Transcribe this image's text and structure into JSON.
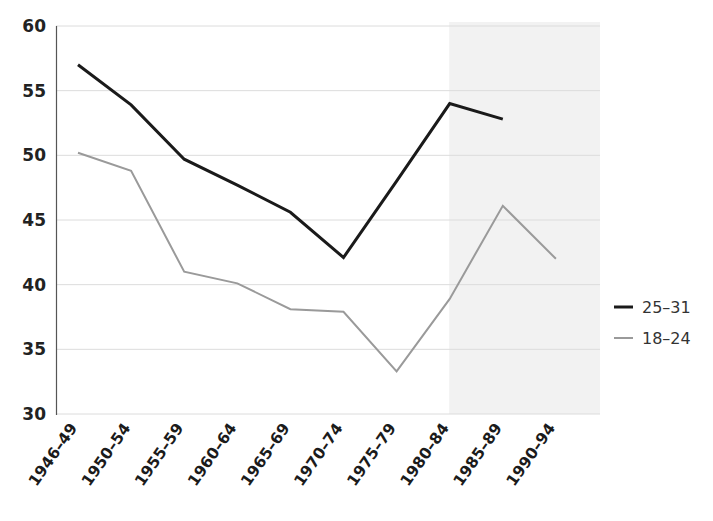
{
  "chart_data": {
    "type": "line",
    "title": "",
    "xlabel": "",
    "ylabel": "",
    "categories": [
      "1946–49",
      "1950–54",
      "1955–59",
      "1960–64",
      "1965–69",
      "1970–74",
      "1975–79",
      "1980–84",
      "1985–89",
      "1990–94"
    ],
    "ylim": [
      30,
      60
    ],
    "yticks": [
      30,
      35,
      40,
      45,
      50,
      55,
      60
    ],
    "ytick_labels": [
      "30",
      "35",
      "40",
      "45",
      "50",
      "55",
      "60"
    ],
    "grid": true,
    "grid_axis": "y",
    "legend_position": "right",
    "series": [
      {
        "name": "25–31",
        "color": "#1a1a1a",
        "line_width": 3.0,
        "values": [
          57.0,
          53.9,
          49.7,
          47.7,
          45.6,
          42.1,
          48.0,
          54.0,
          52.8,
          null
        ]
      },
      {
        "name": "18–24",
        "color": "#9a9a9a",
        "line_width": 2.0,
        "values": [
          50.2,
          48.8,
          41.0,
          40.1,
          38.1,
          37.9,
          33.3,
          38.9,
          46.1,
          42.0
        ]
      }
    ],
    "shaded_region": {
      "from_category": "1980–84",
      "to_category": "1990–94",
      "color": "#f2f2f2",
      "label": ""
    },
    "annotations": []
  },
  "legend": {
    "items": [
      {
        "label": "25–31",
        "color": "#1a1a1a",
        "width": 3.0
      },
      {
        "label": "18–24",
        "color": "#9a9a9a",
        "width": 2.0
      }
    ]
  },
  "axes": {
    "y_axis_line_color": "#555555",
    "grid_color": "#dcdcdc",
    "plot_background": "#ffffff"
  }
}
